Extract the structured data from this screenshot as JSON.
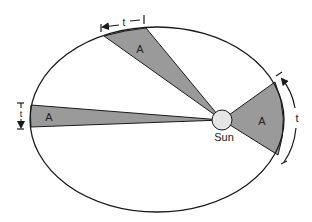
{
  "diagram": {
    "colors": {
      "background": "#ffffff",
      "orbit_stroke": "#1a1a1a",
      "wedge_fill": "#9a9a9a",
      "sun_fill": "#e6e6e6"
    },
    "orbit": {
      "cx": 157,
      "cy": 119.5,
      "rx": 127,
      "ry": 92.5
    },
    "sun": {
      "label": "Sun",
      "cx": 222,
      "cy": 120,
      "r": 10
    },
    "wedges": [
      {
        "id": "top",
        "area_label": "A",
        "time_label": "t"
      },
      {
        "id": "left",
        "area_label": "A",
        "time_label": "t"
      },
      {
        "id": "right",
        "area_label": "A",
        "time_label": "t"
      }
    ]
  }
}
